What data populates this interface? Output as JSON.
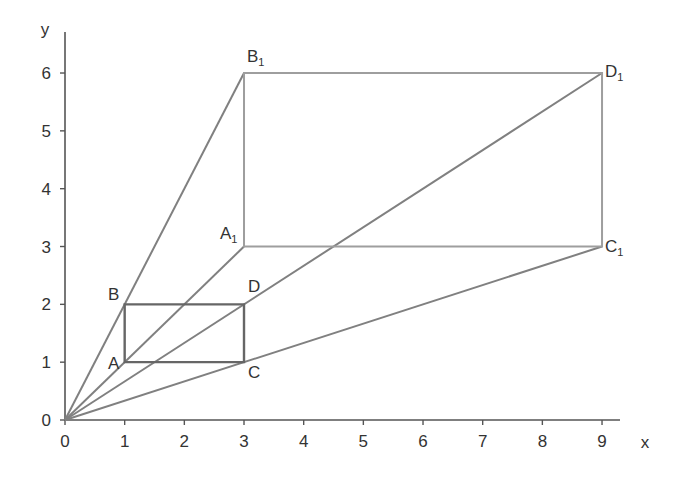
{
  "chart_data": {
    "type": "diagram",
    "title": "",
    "xlabel": "x",
    "ylabel": "y",
    "xlim": [
      0,
      9.7
    ],
    "ylim": [
      0,
      6.8
    ],
    "x_ticks": [
      "0",
      "1",
      "2",
      "3",
      "4",
      "5",
      "6",
      "7",
      "8",
      "9"
    ],
    "y_ticks": [
      "0",
      "1",
      "2",
      "3",
      "4",
      "5",
      "6"
    ],
    "grid": false,
    "points": [
      {
        "name": "A",
        "x": 1,
        "y": 1
      },
      {
        "name": "B",
        "x": 1,
        "y": 2
      },
      {
        "name": "C",
        "x": 3,
        "y": 1
      },
      {
        "name": "D",
        "x": 3,
        "y": 2
      },
      {
        "name": "A1",
        "x": 3,
        "y": 3
      },
      {
        "name": "B1",
        "x": 3,
        "y": 6
      },
      {
        "name": "C1",
        "x": 9,
        "y": 3
      },
      {
        "name": "D1",
        "x": 9,
        "y": 6
      }
    ],
    "shapes": [
      {
        "name": "rectangle ABDC",
        "vertices": [
          "A",
          "B",
          "D",
          "C"
        ],
        "color": "#666666"
      },
      {
        "name": "rectangle A1B1D1C1",
        "vertices": [
          "A1",
          "B1",
          "D1",
          "C1"
        ],
        "color": "#9a9a9a"
      }
    ],
    "rays_from_origin": [
      "B1",
      "A1",
      "D1",
      "C1"
    ]
  },
  "labels": {
    "x_axis": "x",
    "y_axis": "y",
    "A": "A",
    "B": "B",
    "C": "C",
    "D": "D",
    "A1": "A",
    "B1": "B",
    "C1": "C",
    "D1": "D",
    "sub": "1"
  },
  "colors": {
    "axis": "#555555",
    "small_rect": "#666666",
    "large_rect": "#9e9e9e",
    "rays": "#808080",
    "text": "#333333"
  }
}
